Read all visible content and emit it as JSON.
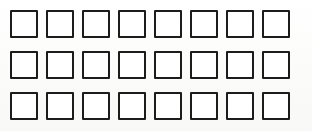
{
  "page": {
    "background_color": "#fdfdfc",
    "width": 312,
    "height": 131
  },
  "grid": {
    "name": "checkbox-grid",
    "rows": 3,
    "columns": 8,
    "total_cells": 24,
    "cell_size_px": 28,
    "column_gap_px": 8,
    "row_gap_px": 13,
    "origin_x_px": 10,
    "origin_y_px": 10,
    "border_width_px": 2,
    "border_color": "#1c1c1c",
    "fill_color": "#ffffff",
    "all_unchecked": true,
    "rows_data": [
      {
        "row_index": 1,
        "cells": [
          {
            "id": "r1c1",
            "checked": false,
            "label": ""
          },
          {
            "id": "r1c2",
            "checked": false,
            "label": ""
          },
          {
            "id": "r1c3",
            "checked": false,
            "label": ""
          },
          {
            "id": "r1c4",
            "checked": false,
            "label": ""
          },
          {
            "id": "r1c5",
            "checked": false,
            "label": ""
          },
          {
            "id": "r1c6",
            "checked": false,
            "label": ""
          },
          {
            "id": "r1c7",
            "checked": false,
            "label": ""
          },
          {
            "id": "r1c8",
            "checked": false,
            "label": ""
          }
        ]
      },
      {
        "row_index": 2,
        "cells": [
          {
            "id": "r2c1",
            "checked": false,
            "label": ""
          },
          {
            "id": "r2c2",
            "checked": false,
            "label": ""
          },
          {
            "id": "r2c3",
            "checked": false,
            "label": ""
          },
          {
            "id": "r2c4",
            "checked": false,
            "label": ""
          },
          {
            "id": "r2c5",
            "checked": false,
            "label": ""
          },
          {
            "id": "r2c6",
            "checked": false,
            "label": ""
          },
          {
            "id": "r2c7",
            "checked": false,
            "label": ""
          },
          {
            "id": "r2c8",
            "checked": false,
            "label": ""
          }
        ]
      },
      {
        "row_index": 3,
        "cells": [
          {
            "id": "r3c1",
            "checked": false,
            "label": ""
          },
          {
            "id": "r3c2",
            "checked": false,
            "label": ""
          },
          {
            "id": "r3c3",
            "checked": false,
            "label": ""
          },
          {
            "id": "r3c4",
            "checked": false,
            "label": ""
          },
          {
            "id": "r3c5",
            "checked": false,
            "label": ""
          },
          {
            "id": "r3c6",
            "checked": false,
            "label": ""
          },
          {
            "id": "r3c7",
            "checked": false,
            "label": ""
          },
          {
            "id": "r3c8",
            "checked": false,
            "label": ""
          }
        ]
      }
    ]
  }
}
